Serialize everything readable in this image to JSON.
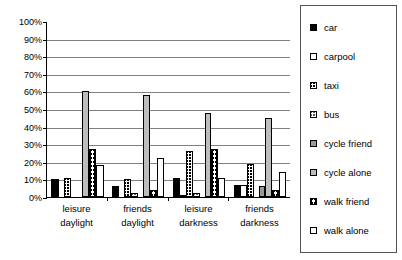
{
  "chart_data": {
    "type": "bar",
    "title": "",
    "xlabel": "",
    "ylabel": "",
    "ylim": [
      0,
      100
    ],
    "ytick_labels": [
      "100%",
      "90%",
      "80%",
      "70%",
      "60%",
      "50%",
      "40%",
      "30%",
      "20%",
      "10%",
      "0%"
    ],
    "ytick_values": [
      100,
      90,
      80,
      70,
      60,
      50,
      40,
      30,
      20,
      10,
      0
    ],
    "grid": true,
    "legend_position": "right",
    "categories": [
      "leisure daylight",
      "friends daylight",
      "leisure darkness",
      "friends darkness"
    ],
    "category_lines": [
      [
        "leisure",
        "daylight"
      ],
      [
        "friends",
        "daylight"
      ],
      [
        "leisure",
        "darkness"
      ],
      [
        "friends",
        "darkness"
      ]
    ],
    "series": [
      {
        "name": "car",
        "pattern": "solid-black",
        "values": [
          10,
          6,
          11,
          7
        ]
      },
      {
        "name": "carpool",
        "pattern": "diagonal-grey",
        "values": [
          0,
          0,
          1,
          7
        ]
      },
      {
        "name": "taxi",
        "pattern": "fine-crosshatch",
        "values": [
          11,
          10,
          26,
          19
        ]
      },
      {
        "name": "bus",
        "pattern": "dotted-grid",
        "values": [
          0,
          2,
          2,
          0
        ]
      },
      {
        "name": "cycle friend",
        "pattern": "solid-grey",
        "values": [
          0,
          0,
          0,
          6
        ]
      },
      {
        "name": "cycle alone",
        "pattern": "light-grey",
        "values": [
          60,
          58,
          48,
          45
        ]
      },
      {
        "name": "walk friend",
        "pattern": "crosshatch",
        "values": [
          27,
          4,
          27,
          4
        ]
      },
      {
        "name": "walk alone",
        "pattern": "white",
        "values": [
          18,
          22,
          11,
          14
        ]
      }
    ]
  },
  "legend": {
    "items": [
      {
        "label": "car",
        "swatch": "legend-swatch-car"
      },
      {
        "label": "carpool",
        "swatch": "legend-swatch-carpool"
      },
      {
        "label": "taxi",
        "swatch": "legend-swatch-taxi"
      },
      {
        "label": "bus",
        "swatch": "legend-swatch-bus"
      },
      {
        "label": "cycle friend",
        "swatch": "legend-swatch-cycle-friend"
      },
      {
        "label": "cycle alone",
        "swatch": "legend-swatch-cycle-alone"
      },
      {
        "label": "walk friend",
        "swatch": "legend-swatch-walk-friend"
      },
      {
        "label": "walk alone",
        "swatch": "legend-swatch-walk-alone"
      }
    ]
  },
  "colors": {
    "axis": "#000000",
    "gridline": "#808080",
    "legend_border": "#555555",
    "background": "#ffffff",
    "car": "#000000",
    "cycle_friend": "#999999",
    "cycle_alone": "#bdbdbd"
  }
}
